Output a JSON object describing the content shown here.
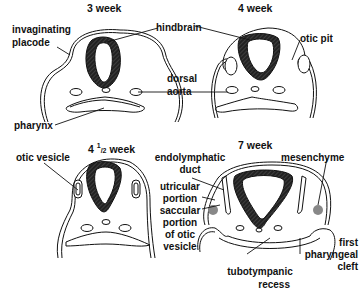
{
  "panels": [
    {
      "id": "3-week",
      "title": "3 week"
    },
    {
      "id": "4-week",
      "title": "4 week"
    },
    {
      "id": "4-half-week",
      "title_pre": "4 ",
      "title_sup": "1",
      "title_sub": "/2",
      "title_post": " week"
    },
    {
      "id": "7-week",
      "title": "7 week"
    }
  ],
  "labels": {
    "invaginating_placode_1": "invaginating",
    "invaginating_placode_2": "placode",
    "hindbrain": "hindbrain",
    "otic_pit": "otic pit",
    "dorsal": "dorsal",
    "aorta": "aorta",
    "pharynx": "pharynx",
    "otic_vesicle": "otic vesicle",
    "endolymphatic_1": "endolymphatic",
    "endolymphatic_2": "duct",
    "utricular_1": "utricular",
    "utricular_2": "portion",
    "saccular_1": "saccular",
    "saccular_2": "portion",
    "saccular_3": "of otic",
    "saccular_4": "vesicle",
    "mesenchyme": "mesenchyme",
    "first_1": "first",
    "first_2": "pharyngeal",
    "first_3": "cleft",
    "tubo_1": "tubotympanic",
    "tubo_2": "recess"
  },
  "colors": {
    "ink": "#111111",
    "hatch": "#2a2a2a",
    "mesenchyme": "#888888"
  }
}
